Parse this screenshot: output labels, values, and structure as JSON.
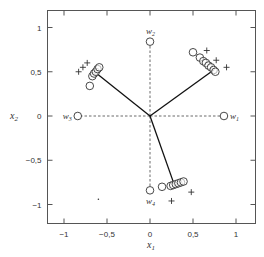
{
  "figure": {
    "xlabel": "x",
    "xlabel_sub": "1",
    "ylabel": "x",
    "ylabel_sub": "2",
    "xticks": [
      {
        "v": -1,
        "label": "-1"
      },
      {
        "v": -0.5,
        "label": "-0,5"
      },
      {
        "v": 0,
        "label": "0"
      },
      {
        "v": 0.5,
        "label": "0,5"
      },
      {
        "v": 1,
        "label": "1"
      }
    ],
    "yticks": [
      {
        "v": 1,
        "label": "1"
      },
      {
        "v": 0.5,
        "label": "0,5"
      },
      {
        "v": 0,
        "label": "0"
      },
      {
        "v": -0.5,
        "label": "-0,5"
      },
      {
        "v": -1,
        "label": "-1"
      }
    ],
    "weight_labels": [
      {
        "name": "w",
        "sub": "1"
      },
      {
        "name": "w",
        "sub": "2"
      },
      {
        "name": "w",
        "sub": "3"
      },
      {
        "name": "w",
        "sub": "4"
      }
    ]
  },
  "chart_data": {
    "type": "scatter",
    "title": "",
    "xlabel": "x1",
    "ylabel": "x2",
    "xlim": [
      -1.2,
      1.22
    ],
    "ylim": [
      -1.2,
      1.2
    ],
    "grid": false,
    "series": [
      {
        "name": "initial weights w1..w4 (open circles, dashed lines to origin)",
        "points": [
          {
            "label": "w1",
            "x": 0.86,
            "y": 0.0
          },
          {
            "label": "w2",
            "x": 0.0,
            "y": 0.84
          },
          {
            "label": "w3",
            "x": -0.84,
            "y": 0.0
          },
          {
            "label": "w4",
            "x": 0.0,
            "y": -0.84
          }
        ]
      },
      {
        "name": "weight trajectories (circles)",
        "points": [
          {
            "x": 0.5,
            "y": 0.72
          },
          {
            "x": 0.58,
            "y": 0.66
          },
          {
            "x": 0.62,
            "y": 0.62
          },
          {
            "x": 0.65,
            "y": 0.6
          },
          {
            "x": 0.68,
            "y": 0.57
          },
          {
            "x": 0.71,
            "y": 0.55
          },
          {
            "x": 0.74,
            "y": 0.52
          },
          {
            "x": 0.76,
            "y": 0.5
          },
          {
            "x": -0.7,
            "y": 0.34
          },
          {
            "x": -0.67,
            "y": 0.45
          },
          {
            "x": -0.65,
            "y": 0.48
          },
          {
            "x": -0.63,
            "y": 0.5
          },
          {
            "x": -0.61,
            "y": 0.53
          },
          {
            "x": -0.59,
            "y": 0.55
          },
          {
            "x": 0.14,
            "y": -0.8
          },
          {
            "x": 0.24,
            "y": -0.79
          },
          {
            "x": 0.27,
            "y": -0.78
          },
          {
            "x": 0.3,
            "y": -0.77
          },
          {
            "x": 0.33,
            "y": -0.76
          },
          {
            "x": 0.36,
            "y": -0.75
          },
          {
            "x": 0.39,
            "y": -0.74
          }
        ]
      },
      {
        "name": "input samples (+)",
        "points": [
          {
            "x": 0.66,
            "y": 0.74
          },
          {
            "x": 0.77,
            "y": 0.63
          },
          {
            "x": 0.89,
            "y": 0.55
          },
          {
            "x": -0.83,
            "y": 0.5
          },
          {
            "x": -0.78,
            "y": 0.55
          },
          {
            "x": -0.73,
            "y": 0.6
          },
          {
            "x": 0.25,
            "y": -0.96
          },
          {
            "x": 0.48,
            "y": -0.86
          }
        ]
      },
      {
        "name": "final weight vectors (solid lines from origin)",
        "points": [
          {
            "x": 0.74,
            "y": 0.52
          },
          {
            "x": -0.62,
            "y": 0.48
          },
          {
            "x": 0.28,
            "y": -0.77
          }
        ]
      },
      {
        "name": "dot",
        "points": [
          {
            "x": -0.6,
            "y": -0.94
          }
        ]
      }
    ]
  }
}
